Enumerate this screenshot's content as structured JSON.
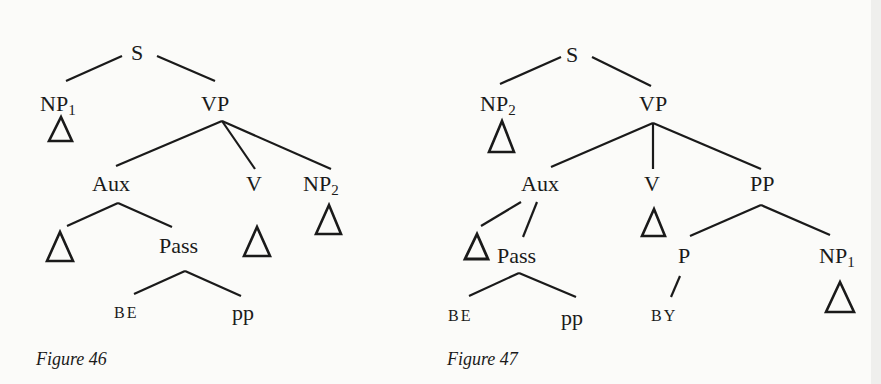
{
  "figures": [
    {
      "caption": "Figure 46",
      "nodes": {
        "S": "S",
        "NP1": "NP",
        "NP1_sub": "1",
        "VP": "VP",
        "Aux": "Aux",
        "V": "V",
        "NP2": "NP",
        "NP2_sub": "2",
        "Pass": "Pass",
        "BE": "BE",
        "pp": "pp"
      }
    },
    {
      "caption": "Figure 47",
      "nodes": {
        "S": "S",
        "NP2": "NP",
        "NP2_sub": "2",
        "VP": "VP",
        "Aux": "Aux",
        "V": "V",
        "PP": "PP",
        "Pass": "Pass",
        "P": "P",
        "NP1": "NP",
        "NP1_sub": "1",
        "BE": "BE",
        "pp": "pp",
        "BY": "BY"
      }
    }
  ],
  "colors": {
    "ink": "#1a1a1a",
    "paper": "#fbfbf9"
  }
}
